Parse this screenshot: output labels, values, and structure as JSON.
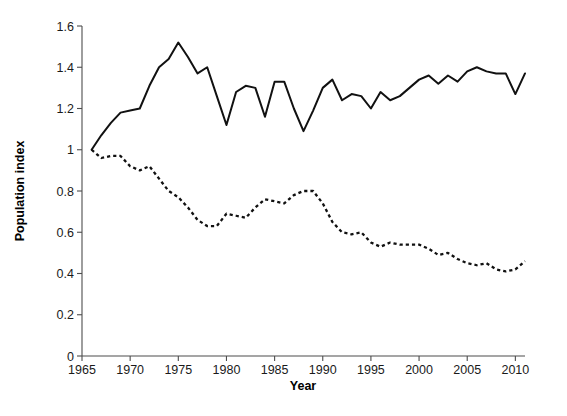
{
  "chart_data": {
    "type": "line",
    "title": "",
    "xlabel": "Year",
    "ylabel": "Population index",
    "xlim": [
      1965,
      2011
    ],
    "ylim": [
      0,
      1.6
    ],
    "grid": false,
    "legend": "none",
    "xticks": [
      "1965",
      "1970",
      "1975",
      "1980",
      "1985",
      "1990",
      "1995",
      "2000",
      "2005",
      "2010"
    ],
    "xtick_values": [
      1965,
      1970,
      1975,
      1980,
      1985,
      1990,
      1995,
      2000,
      2005,
      2010
    ],
    "yticks": [
      "0",
      "0.2",
      "0.4",
      "0.6",
      "0.8",
      "1",
      "1.2",
      "1.4",
      "1.6"
    ],
    "ytick_values": [
      0,
      0.2,
      0.4,
      0.6,
      0.8,
      1,
      1.2,
      1.4,
      1.6
    ],
    "x": [
      1966,
      1967,
      1968,
      1969,
      1970,
      1971,
      1972,
      1973,
      1974,
      1975,
      1976,
      1977,
      1978,
      1979,
      1980,
      1981,
      1982,
      1983,
      1984,
      1985,
      1986,
      1987,
      1988,
      1989,
      1990,
      1991,
      1992,
      1993,
      1994,
      1995,
      1996,
      1997,
      1998,
      1999,
      2000,
      2001,
      2002,
      2003,
      2004,
      2005,
      2006,
      2007,
      2008,
      2009,
      2010,
      2011
    ],
    "series": [
      {
        "name": "solid-series",
        "style": "solid",
        "color": "#111111",
        "values": [
          1.0,
          1.07,
          1.13,
          1.18,
          1.19,
          1.2,
          1.31,
          1.4,
          1.44,
          1.52,
          1.45,
          1.37,
          1.4,
          1.26,
          1.12,
          1.28,
          1.31,
          1.3,
          1.16,
          1.33,
          1.33,
          1.2,
          1.09,
          1.19,
          1.3,
          1.34,
          1.24,
          1.27,
          1.26,
          1.2,
          1.28,
          1.24,
          1.26,
          1.3,
          1.34,
          1.36,
          1.32,
          1.36,
          1.33,
          1.38,
          1.4,
          1.38,
          1.37,
          1.37,
          1.27,
          1.37
        ]
      },
      {
        "name": "dashed-series",
        "style": "dashed",
        "color": "#111111",
        "values": [
          1.0,
          0.96,
          0.97,
          0.97,
          0.92,
          0.9,
          0.92,
          0.86,
          0.8,
          0.77,
          0.72,
          0.66,
          0.63,
          0.63,
          0.69,
          0.68,
          0.67,
          0.72,
          0.76,
          0.75,
          0.74,
          0.78,
          0.8,
          0.8,
          0.74,
          0.65,
          0.6,
          0.59,
          0.6,
          0.55,
          0.53,
          0.55,
          0.54,
          0.54,
          0.54,
          0.52,
          0.49,
          0.5,
          0.47,
          0.45,
          0.44,
          0.45,
          0.42,
          0.41,
          0.42,
          0.46
        ]
      }
    ]
  }
}
